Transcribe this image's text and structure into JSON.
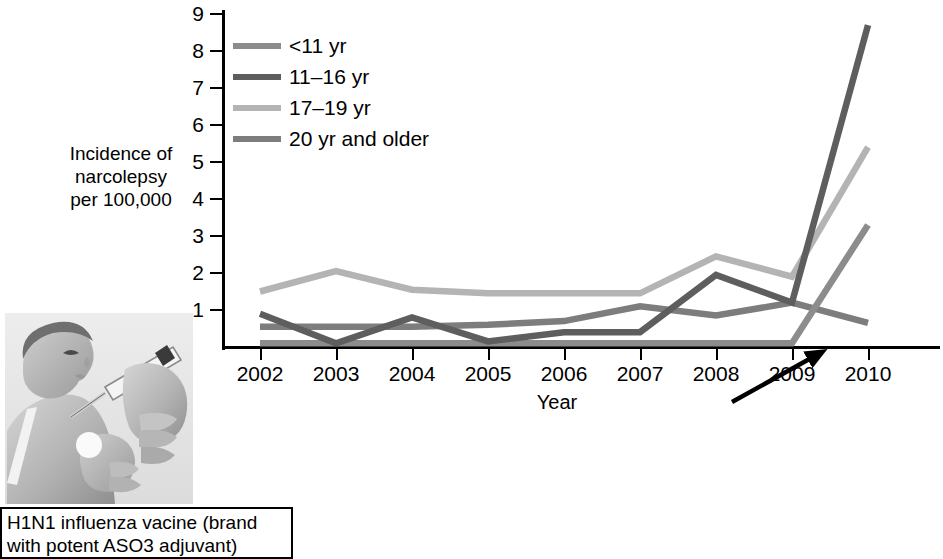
{
  "figure": {
    "background_color": "#ffffff"
  },
  "chart_data": {
    "type": "line",
    "title": "",
    "xlabel": "Year",
    "ylabel": "Incidence of\nnarcolepsy\nper 100,000",
    "categories": [
      "2002",
      "2003",
      "2004",
      "2005",
      "2006",
      "2007",
      "2008",
      "2009",
      "2010"
    ],
    "x": [
      2002,
      2003,
      2004,
      2005,
      2006,
      2007,
      2008,
      2009,
      2010
    ],
    "xlim": [
      2002,
      2010
    ],
    "ylim": [
      0,
      9
    ],
    "yticks": [
      "1",
      "2",
      "3",
      "4",
      "5",
      "6",
      "7",
      "8",
      "9"
    ],
    "ytick_values": [
      1,
      2,
      3,
      4,
      5,
      6,
      7,
      8,
      9
    ],
    "grid": false,
    "legend_position": "upper-left inside plot",
    "series": [
      {
        "name": "<11 yr",
        "color": "#8c8c8c",
        "values": [
          0.1,
          0.1,
          0.1,
          0.1,
          0.1,
          0.1,
          0.1,
          0.1,
          3.3
        ]
      },
      {
        "name": "11–16 yr",
        "color": "#5e5e5e",
        "values": [
          0.9,
          0.1,
          0.8,
          0.15,
          0.4,
          0.4,
          1.95,
          1.2,
          8.7
        ]
      },
      {
        "name": "17–19 yr",
        "color": "#b4b4b4",
        "values": [
          1.5,
          2.05,
          1.55,
          1.45,
          1.45,
          1.45,
          2.45,
          1.9,
          5.4
        ]
      },
      {
        "name": "20 yr and older",
        "color": "#7d7d7d",
        "values": [
          0.55,
          0.55,
          0.55,
          0.6,
          0.7,
          1.1,
          0.85,
          1.2,
          0.65
        ]
      }
    ],
    "annotations": [
      {
        "kind": "arrow",
        "points_to_year": "2009",
        "points_to_value": 0,
        "label": "H1N1 influenza vacine (brand with potent ASO3 adjuvant)"
      }
    ]
  },
  "axes": {
    "y_title": "Incidence of\nnarcolepsy\nper 100,000",
    "x_title": "Year",
    "y_labels": [
      "9",
      "8",
      "7",
      "6",
      "5",
      "4",
      "3",
      "2",
      "1"
    ],
    "x_labels": [
      "2002",
      "2003",
      "2004",
      "2005",
      "2006",
      "2007",
      "2008",
      "2009",
      "2010"
    ]
  },
  "legend": {
    "items": [
      {
        "label": "<11 yr",
        "color": "#8c8c8c"
      },
      {
        "label": "11–16 yr",
        "color": "#5e5e5e"
      },
      {
        "label": "17–19 yr",
        "color": "#b4b4b4"
      },
      {
        "label": "20 yr and older",
        "color": "#7d7d7d"
      }
    ]
  },
  "caption": {
    "text": "H1N1 influenza vacine (brand\nwith potent ASO3 adjuvant)"
  },
  "photo": {
    "alt_name": "child-receiving-vaccination-photo"
  }
}
